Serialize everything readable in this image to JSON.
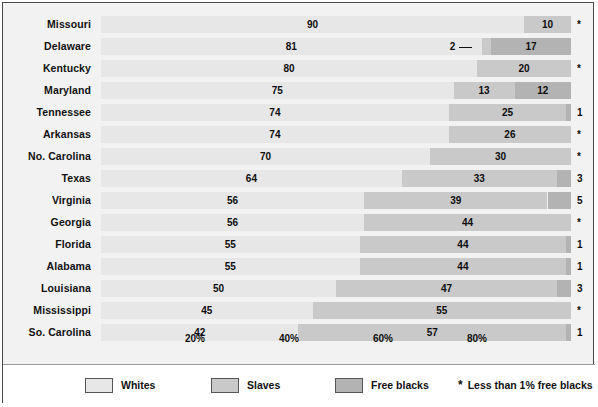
{
  "chart_data": {
    "type": "bar",
    "subtype": "stacked-horizontal-100pct",
    "title": "",
    "xlabel": "",
    "ylabel": "",
    "xlim": [
      0,
      100
    ],
    "grid": false,
    "legend_position": "bottom",
    "categories": [
      "Missouri",
      "Delaware",
      "Kentucky",
      "Maryland",
      "Tennessee",
      "Arkansas",
      "No. Carolina",
      "Texas",
      "Virginia",
      "Georgia",
      "Florida",
      "Alabama",
      "Louisiana",
      "Mississippi",
      "So. Carolina"
    ],
    "series": [
      {
        "name": "Whites",
        "values": [
          90,
          81,
          80,
          75,
          74,
          74,
          70,
          64,
          56,
          56,
          55,
          55,
          50,
          45,
          42
        ]
      },
      {
        "name": "Slaves",
        "values": [
          10,
          2,
          20,
          13,
          25,
          26,
          30,
          33,
          39,
          44,
          44,
          44,
          47,
          55,
          57
        ]
      },
      {
        "name": "Free blacks",
        "values": [
          0,
          17,
          0,
          12,
          1,
          0,
          0,
          3,
          5,
          0,
          1,
          1,
          3,
          0,
          1
        ]
      }
    ],
    "tick_labels": [
      "20%",
      "40%",
      "60%",
      "80%"
    ],
    "tick_values": [
      20,
      40,
      60,
      80
    ],
    "free_black_marks": [
      "*",
      "17",
      "*",
      "12",
      "1",
      "*",
      "*",
      "3",
      "5",
      "*",
      "1",
      "1",
      "3",
      "*",
      "1"
    ],
    "annotations": [
      {
        "row": "Delaware",
        "text": "2",
        "note": "leader line to thin slaves segment"
      }
    ]
  },
  "rows": [
    {
      "label": "Missouri",
      "whites": 90,
      "slaves": 10,
      "free": 0,
      "whites_lbl": "90",
      "slaves_lbl": "10",
      "free_lbl": "",
      "outside": "*",
      "outside_is_star": true
    },
    {
      "label": "Delaware",
      "whites": 81,
      "slaves": 2,
      "free": 17,
      "whites_lbl": "81",
      "slaves_lbl": "",
      "free_lbl": "17",
      "outside": "",
      "outside_is_star": false,
      "callout": "2"
    },
    {
      "label": "Kentucky",
      "whites": 80,
      "slaves": 20,
      "free": 0,
      "whites_lbl": "80",
      "slaves_lbl": "20",
      "free_lbl": "",
      "outside": "*",
      "outside_is_star": true
    },
    {
      "label": "Maryland",
      "whites": 75,
      "slaves": 13,
      "free": 12,
      "whites_lbl": "75",
      "slaves_lbl": "13",
      "free_lbl": "12",
      "outside": "",
      "outside_is_star": false
    },
    {
      "label": "Tennessee",
      "whites": 74,
      "slaves": 25,
      "free": 1,
      "whites_lbl": "74",
      "slaves_lbl": "25",
      "free_lbl": "",
      "outside": "1",
      "outside_is_star": false
    },
    {
      "label": "Arkansas",
      "whites": 74,
      "slaves": 26,
      "free": 0,
      "whites_lbl": "74",
      "slaves_lbl": "26",
      "free_lbl": "",
      "outside": "*",
      "outside_is_star": true
    },
    {
      "label": "No. Carolina",
      "whites": 70,
      "slaves": 30,
      "free": 0,
      "whites_lbl": "70",
      "slaves_lbl": "30",
      "free_lbl": "",
      "outside": "*",
      "outside_is_star": true
    },
    {
      "label": "Texas",
      "whites": 64,
      "slaves": 33,
      "free": 3,
      "whites_lbl": "64",
      "slaves_lbl": "33",
      "free_lbl": "",
      "outside": "3",
      "outside_is_star": false
    },
    {
      "label": "Virginia",
      "whites": 56,
      "slaves": 39,
      "free": 5,
      "whites_lbl": "56",
      "slaves_lbl": "39",
      "free_lbl": "",
      "outside": "5",
      "outside_is_star": false
    },
    {
      "label": "Georgia",
      "whites": 56,
      "slaves": 44,
      "free": 0,
      "whites_lbl": "56",
      "slaves_lbl": "44",
      "free_lbl": "",
      "outside": "*",
      "outside_is_star": true
    },
    {
      "label": "Florida",
      "whites": 55,
      "slaves": 44,
      "free": 1,
      "whites_lbl": "55",
      "slaves_lbl": "44",
      "free_lbl": "",
      "outside": "1",
      "outside_is_star": false
    },
    {
      "label": "Alabama",
      "whites": 55,
      "slaves": 44,
      "free": 1,
      "whites_lbl": "55",
      "slaves_lbl": "44",
      "free_lbl": "",
      "outside": "1",
      "outside_is_star": false
    },
    {
      "label": "Louisiana",
      "whites": 50,
      "slaves": 47,
      "free": 3,
      "whites_lbl": "50",
      "slaves_lbl": "47",
      "free_lbl": "",
      "outside": "3",
      "outside_is_star": false
    },
    {
      "label": "Mississippi",
      "whites": 45,
      "slaves": 55,
      "free": 0,
      "whites_lbl": "45",
      "slaves_lbl": "55",
      "free_lbl": "",
      "outside": "*",
      "outside_is_star": true
    },
    {
      "label": "So. Carolina",
      "whites": 42,
      "slaves": 57,
      "free": 1,
      "whites_lbl": "42",
      "slaves_lbl": "57",
      "free_lbl": "",
      "outside": "1",
      "outside_is_star": false
    }
  ],
  "axis": {
    "ticks": [
      {
        "label": "20%",
        "value": 20
      },
      {
        "label": "40%",
        "value": 40
      },
      {
        "label": "60%",
        "value": 60
      },
      {
        "label": "80%",
        "value": 80
      }
    ]
  },
  "legend": {
    "items": [
      {
        "label": "Whites",
        "color": "#e7e7e7"
      },
      {
        "label": "Slaves",
        "color": "#c9c9c9"
      },
      {
        "label": "Free blacks",
        "color": "#b3b3b3"
      }
    ],
    "footnote_symbol": "*",
    "footnote": "Less than 1% free blacks"
  },
  "colors": {
    "whites": "#e7e7e7",
    "slaves": "#c9c9c9",
    "free_blacks": "#b3b3b3",
    "background": "#f2f2f2",
    "border": "#4a4a4a",
    "text": "#111111"
  }
}
